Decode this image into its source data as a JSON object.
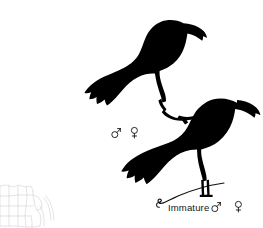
{
  "plate": {
    "width": 263,
    "height": 228,
    "background_color": "#ffffff",
    "ink_color": "#000000",
    "map_line_color": "#cfcfcf",
    "title": ""
  },
  "figures": [
    {
      "id": "adult",
      "name": "adult-bird-silhouette",
      "description": "",
      "label": "",
      "sex_symbols": [
        "♂",
        "♀"
      ]
    },
    {
      "id": "immature",
      "name": "immature-bird-silhouette",
      "description": "",
      "label": "Immature",
      "sex_symbols": [
        "♂",
        "♀"
      ]
    }
  ],
  "labels": {
    "immature": "Immature"
  },
  "symbols": {
    "male": "♂",
    "female": "♀",
    "male_name": "male-symbol",
    "female_name": "female-symbol"
  },
  "range_map": {
    "name": "range-map",
    "caption": "",
    "visible": true
  }
}
